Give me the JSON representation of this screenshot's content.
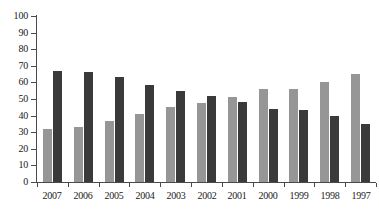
{
  "chart_data": {
    "type": "bar",
    "title": "",
    "subtitle": "",
    "xlabel": "",
    "ylabel": "",
    "ylim": [
      0,
      100
    ],
    "ytick_step": 10,
    "ytick_labels": [
      "100",
      "90",
      "80",
      "70",
      "60",
      "50",
      "40",
      "30",
      "20",
      "10",
      "0"
    ],
    "ytick_values": [
      100,
      90,
      80,
      70,
      60,
      50,
      40,
      30,
      20,
      10,
      0
    ],
    "grid": false,
    "legend": false,
    "legend_position": "none",
    "orientation": "vertical",
    "group_mode": "clustered",
    "categories": [
      "2007",
      "2006",
      "2005",
      "2004",
      "2003",
      "2002",
      "2001",
      "2000",
      "1999",
      "1998",
      "1997"
    ],
    "series": [
      {
        "name": "series-a",
        "color": "#969696",
        "values": [
          32,
          33,
          36.5,
          41,
          45,
          47.5,
          51,
          56,
          56,
          60,
          65
        ]
      },
      {
        "name": "series-b",
        "color": "#3a3a3a",
        "values": [
          67,
          66,
          63,
          58.5,
          55,
          52,
          48,
          44,
          43.5,
          40,
          35
        ]
      }
    ],
    "annotations": []
  },
  "colors": {
    "series_a": "#969696",
    "series_b": "#3a3a3a",
    "axis": "#4a4a4a",
    "text": "#1a1a1a",
    "background": "#ffffff"
  }
}
